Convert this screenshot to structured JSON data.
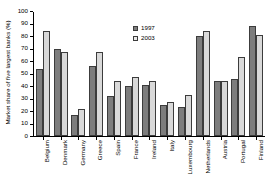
{
  "chart_data": {
    "type": "bar",
    "title": "",
    "xlabel": "",
    "ylabel": "Market share of five largest banks (%)",
    "ylim": [
      0,
      100
    ],
    "yticks": [
      0,
      10,
      20,
      30,
      40,
      50,
      60,
      70,
      80,
      90,
      100
    ],
    "grid": false,
    "legend_position": "top-center",
    "categories": [
      "Belgium",
      "Denmark",
      "Germany",
      "Greece",
      "Spain",
      "France",
      "Ireland",
      "Italy",
      "Luxembourg",
      "Netherlands",
      "Austria",
      "Portugal",
      "Finland"
    ],
    "series": [
      {
        "name": "1997",
        "color": "#7d7d7d",
        "values": [
          54,
          70,
          17,
          56,
          32,
          40,
          41,
          25,
          23,
          80,
          44,
          46,
          88
        ]
      },
      {
        "name": "2003",
        "color": "#d9d9d9",
        "values": [
          84,
          67,
          22,
          67,
          44,
          47,
          44,
          27,
          33,
          84,
          44,
          63,
          81
        ]
      }
    ]
  }
}
